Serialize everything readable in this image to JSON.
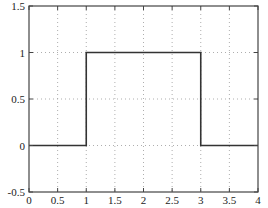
{
  "chart_data": {
    "type": "line",
    "title": "",
    "xlabel": "",
    "ylabel": "",
    "xlim": [
      0,
      4
    ],
    "ylim": [
      -0.5,
      1.5
    ],
    "grid": true,
    "legend": null,
    "x_ticks": [
      0,
      0.5,
      1,
      1.5,
      2,
      2.5,
      3,
      3.5,
      4
    ],
    "x_tick_labels": [
      "0",
      "0.5",
      "1",
      "1.5",
      "2",
      "2.5",
      "3",
      "3.5",
      "4"
    ],
    "y_ticks": [
      -0.5,
      0,
      0.5,
      1,
      1.5
    ],
    "y_tick_labels": [
      "-0.5",
      "0",
      "0.5",
      "1",
      "1.5"
    ],
    "series": [
      {
        "name": "rectangular pulse",
        "color": "#333333",
        "x": [
          0,
          1,
          1,
          3,
          3,
          4
        ],
        "y": [
          0,
          0,
          1,
          1,
          0,
          0
        ]
      }
    ]
  },
  "colors": {
    "axes": "#444444",
    "grid": "#999999",
    "line": "#333333"
  }
}
